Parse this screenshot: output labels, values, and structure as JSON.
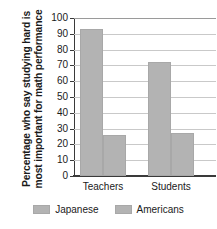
{
  "chart_data": {
    "type": "bar",
    "title": "",
    "xlabel": "",
    "ylabel_line1": "Percentage who say studying hard is",
    "ylabel_line2": "most important for math performance",
    "categories": [
      "Teachers",
      "Students"
    ],
    "series": [
      {
        "name": "Japanese",
        "values": [
          93,
          72
        ],
        "color": "#b3b3b3"
      },
      {
        "name": "Americans",
        "values": [
          26,
          27
        ],
        "color": "#b3b3b3"
      }
    ],
    "ylim": [
      0,
      100
    ],
    "ytick_step": 10,
    "yticks": [
      0,
      10,
      20,
      30,
      40,
      50,
      60,
      70,
      80,
      90,
      100
    ],
    "ytick_labels": [
      "0",
      "10",
      "20",
      "30",
      "40",
      "50",
      "60",
      "70",
      "80",
      "90",
      "100"
    ],
    "grid": true,
    "grid_axis": "y",
    "legend_position": "bottom"
  },
  "legend": {
    "entries": [
      {
        "label": "Japanese",
        "swatch": "legend-swatch-japanese"
      },
      {
        "label": "Americans",
        "swatch": "legend-swatch-americans"
      }
    ]
  },
  "colors": {
    "bar_fill": "#b3b3b3",
    "bar_stroke": "#a8a8a8",
    "axis": "#3a3a3a",
    "grid": "#c9c9c9",
    "text": "#1a1a1a",
    "background": "#ffffff"
  }
}
